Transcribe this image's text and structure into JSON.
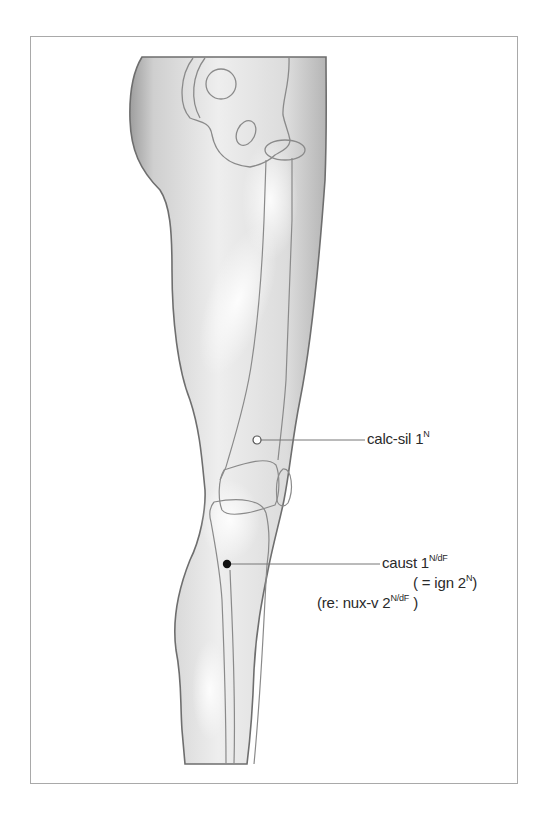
{
  "figure": {
    "border_color": "#a9a9a9",
    "skin_shade": "#d8d8d8",
    "outline_color": "#8a8a8a"
  },
  "points": [
    {
      "id": "calc-sil",
      "marker": "open-circle",
      "label_main": "calc-sil 1",
      "label_sup": "N"
    },
    {
      "id": "caust",
      "marker": "filled-circle",
      "label_main": "caust 1",
      "label_sup": "N/dF",
      "line2_main": "( = ign 2",
      "line2_sup": "N",
      "line2_end": ")",
      "line3_main": "(re: nux-v 2",
      "line3_sup": "N/dF",
      "line3_end": " )"
    }
  ]
}
